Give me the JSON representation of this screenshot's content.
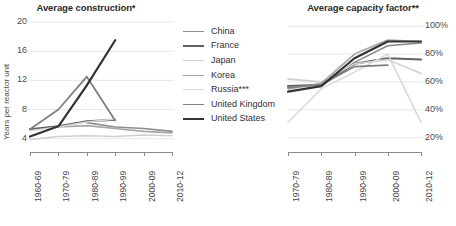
{
  "legend": {
    "items": [
      {
        "label": "China",
        "color": "#8c8c8c",
        "width": 1.6
      },
      {
        "label": "France",
        "color": "#636363",
        "width": 2.0
      },
      {
        "label": "Japan",
        "color": "#cfcfcf",
        "width": 1.6
      },
      {
        "label": "Korea",
        "color": "#a6a6a6",
        "width": 1.6
      },
      {
        "label": "Russia***",
        "color": "#d9d9d9",
        "width": 1.6
      },
      {
        "label": "United Kingdom",
        "color": "#7f7f7f",
        "width": 1.8
      },
      {
        "label": "United States",
        "color": "#333333",
        "width": 2.2
      }
    ]
  },
  "chart_data": [
    {
      "type": "line",
      "title": "Average construction*",
      "xlabel": "",
      "ylabel": "Years per reactor unit",
      "categories": [
        "1960-69",
        "1970-79",
        "1980-89",
        "1990-99",
        "2000-09",
        "2010-12"
      ],
      "yticks": [
        4,
        8,
        12,
        16,
        20
      ],
      "ylim": [
        3.0,
        20.0
      ],
      "grid": true,
      "legend_position": "center",
      "series": [
        {
          "name": "China",
          "color": "#8c8c8c",
          "width": 1.6,
          "values": [
            null,
            null,
            6.2,
            5.6,
            5.4,
            5.0
          ]
        },
        {
          "name": "France",
          "color": "#636363",
          "width": 2.0,
          "values": [
            5.3,
            5.7,
            6.4,
            6.6,
            null,
            null
          ]
        },
        {
          "name": "Japan",
          "color": "#cfcfcf",
          "width": 1.6,
          "values": [
            3.9,
            4.3,
            4.4,
            4.3,
            4.5,
            4.4
          ]
        },
        {
          "name": "Korea",
          "color": "#a6a6a6",
          "width": 1.6,
          "values": [
            null,
            5.6,
            5.8,
            5.4,
            5.0,
            4.8
          ]
        },
        {
          "name": "Russia***",
          "color": "#d9d9d9",
          "width": 1.6,
          "values": [
            5.1,
            5.6,
            6.3,
            6.7,
            null,
            null
          ]
        },
        {
          "name": "United Kingdom",
          "color": "#7f7f7f",
          "width": 1.8,
          "values": [
            5.3,
            8.0,
            12.5,
            6.5,
            null,
            null
          ]
        },
        {
          "name": "United States",
          "color": "#333333",
          "width": 2.2,
          "values": [
            4.3,
            5.7,
            11.3,
            17.5,
            null,
            null
          ]
        }
      ]
    },
    {
      "type": "line",
      "title": "Average capacity factor**",
      "xlabel": "",
      "ylabel": "",
      "categories": [
        "1970-79",
        "1980-89",
        "1990-99",
        "2000-09",
        "2010-12"
      ],
      "yticks": [
        "20%",
        "40%",
        "60%",
        "80%",
        "100%"
      ],
      "ytick_values": [
        20,
        40,
        60,
        80,
        100
      ],
      "ylim": [
        14,
        103
      ],
      "grid": true,
      "legend_position": "shared-center",
      "series": [
        {
          "name": "China",
          "color": "#8c8c8c",
          "width": 1.6,
          "values": [
            null,
            57,
            74,
            86,
            88
          ]
        },
        {
          "name": "France",
          "color": "#636363",
          "width": 2.0,
          "values": [
            57,
            58,
            73,
            77,
            76
          ]
        },
        {
          "name": "Japan",
          "color": "#cfcfcf",
          "width": 1.6,
          "values": [
            62,
            60,
            73,
            76,
            66
          ]
        },
        {
          "name": "Korea",
          "color": "#a6a6a6",
          "width": 1.6,
          "values": [
            55,
            59,
            80,
            90,
            89
          ]
        },
        {
          "name": "Russia***",
          "color": "#d9d9d9",
          "width": 1.6,
          "values": [
            31,
            55,
            67,
            80,
            31
          ]
        },
        {
          "name": "United Kingdom",
          "color": "#7f7f7f",
          "width": 1.8,
          "values": [
            56,
            58,
            71,
            72,
            null
          ]
        },
        {
          "name": "United States",
          "color": "#333333",
          "width": 2.2,
          "values": [
            53,
            57,
            77,
            89,
            89
          ]
        }
      ]
    }
  ]
}
